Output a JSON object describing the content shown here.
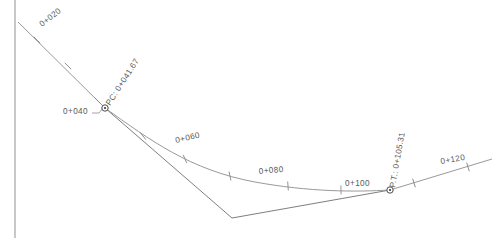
{
  "drawing": {
    "title": "Horizontal Curve Alignment",
    "units": "stations",
    "line_color": "#8d8d8d",
    "text_color": "#59595b",
    "background": "#ffffff"
  },
  "stations": [
    {
      "id": "sta-0-020",
      "label": "0+020",
      "x": 42,
      "y": 27,
      "rotation": -38,
      "tick": true
    },
    {
      "id": "sta-0-040",
      "label": "0+040",
      "x": 63,
      "y": 114,
      "rotation": 0,
      "tick": true
    },
    {
      "id": "sta-0-060",
      "label": "0+060",
      "x": 176,
      "y": 143,
      "rotation": -13,
      "tick": true
    },
    {
      "id": "sta-0-080",
      "label": "0+080",
      "x": 259,
      "y": 174,
      "rotation": -5,
      "tick": true
    },
    {
      "id": "sta-0-100",
      "label": "0+100",
      "x": 345,
      "y": 186,
      "rotation": 0,
      "tick": true
    },
    {
      "id": "sta-0-120",
      "label": "0+120",
      "x": 441,
      "y": 164,
      "rotation": -10,
      "tick": true
    }
  ],
  "control_points": [
    {
      "id": "pc",
      "label": "PC: 0+041.67",
      "x": 105,
      "y": 108,
      "rotation": -57
    },
    {
      "id": "pt",
      "label": "P.T.: 0+105.31",
      "x": 390,
      "y": 190,
      "rotation": -80
    }
  ],
  "geometry": {
    "back_tangent": "M 18,22 L 105,108",
    "pc_to_pi": "M 105,108 L 232,218",
    "pi_to_pt": "M 232,218 L 390,190",
    "forward_tangent": "M 390,190 L 492,159",
    "curve": "M 105,108 C 150,140 190,170 255,182 C 310,192 355,192 390,190",
    "border": "M 15,0 L 15,238"
  },
  "ticks": {
    "back_tangent": [
      {
        "x": 37,
        "y": 40,
        "angle": -45
      },
      {
        "x": 68,
        "y": 66,
        "angle": -45
      },
      {
        "x": 98,
        "y": 101,
        "angle": -45
      }
    ],
    "curve": [
      {
        "x": 143,
        "y": 136,
        "angle": -38
      },
      {
        "x": 185,
        "y": 159,
        "angle": -23
      },
      {
        "x": 230,
        "y": 176,
        "angle": -12
      },
      {
        "x": 288,
        "y": 186,
        "angle": -4
      },
      {
        "x": 341,
        "y": 190,
        "angle": -1
      }
    ],
    "forward_tangent": [
      {
        "x": 414,
        "y": 183,
        "angle": -17
      },
      {
        "x": 468,
        "y": 167,
        "angle": -17
      }
    ]
  },
  "leaders": [
    {
      "id": "leader-0-040",
      "path": "M 92,113 L 99,113 L 103,108"
    }
  ]
}
